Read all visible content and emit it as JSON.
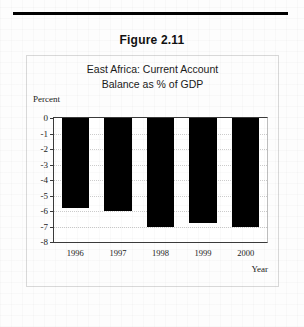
{
  "figure": {
    "caption": "Figure 2.11"
  },
  "chart_data": {
    "type": "bar",
    "title": "East Africa: Current Account Balance  as  % of GDP",
    "title_lines": [
      "East Africa: Current Account",
      "Balance  as  % of GDP"
    ],
    "categories": [
      "1996",
      "1997",
      "1998",
      "1999",
      "2000"
    ],
    "values": [
      -5.8,
      -6.0,
      -7.0,
      -6.8,
      -7.0
    ],
    "xlabel": "Year",
    "ylabel": "Percent",
    "ylim": [
      -8,
      0
    ],
    "yticks": [
      0,
      -1,
      -2,
      -3,
      -4,
      -5,
      -6,
      -7,
      -8
    ],
    "ytick_labels": [
      "0",
      "-1",
      "-2",
      "-3",
      "-4",
      "-5",
      "-6",
      "-7",
      "-8"
    ],
    "grid": true,
    "legend": false,
    "bar_color": "#000000"
  }
}
